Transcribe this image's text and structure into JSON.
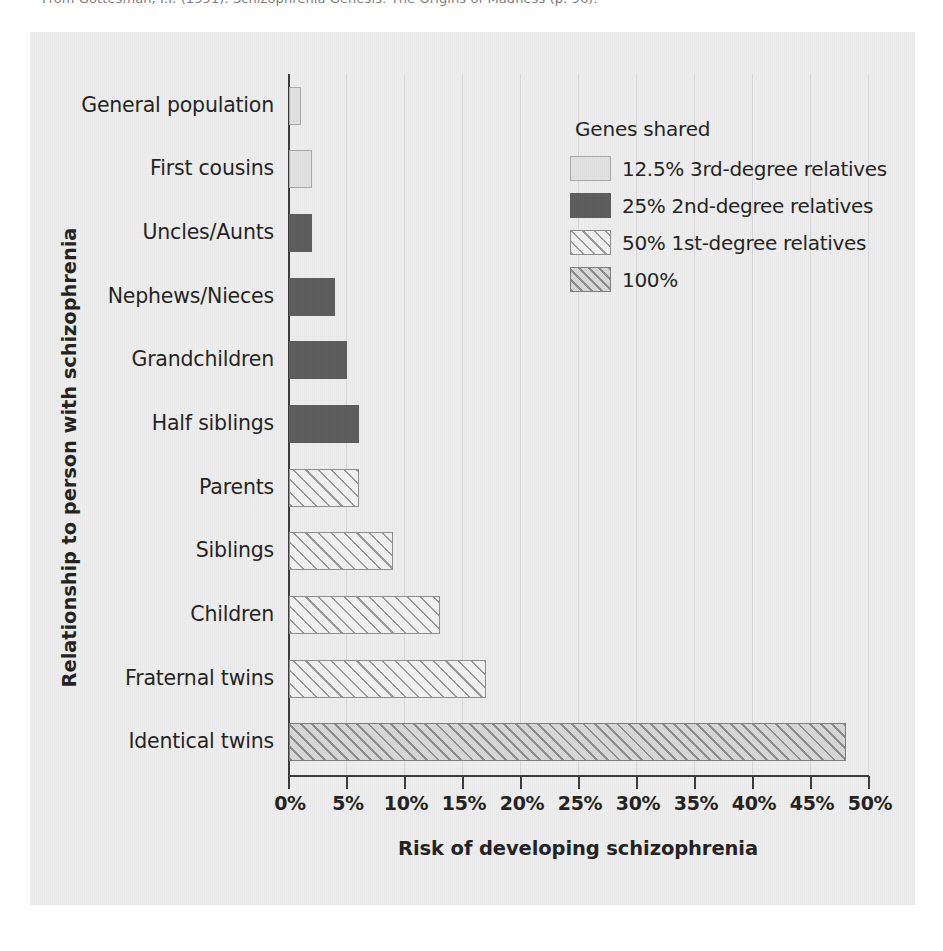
{
  "source_caption": "From Gottesman, I.I. (1991). Schizophrenia Genesis: The Origins of Madness (p. 96).",
  "figure": {
    "background_color": "#eeeeee",
    "axis_color": "#3b3b3b",
    "text_color": "#231f20"
  },
  "legend": {
    "title": "Genes shared",
    "items": [
      {
        "key": "s125",
        "label": "12.5% 3rd-degree relatives",
        "color": "#e2e2e2",
        "pattern": "solid-light"
      },
      {
        "key": "s25",
        "label": "25% 2nd-degree relatives",
        "color": "#5c5c5c",
        "pattern": "solid-dark"
      },
      {
        "key": "s50",
        "label": "50% 1st-degree relatives",
        "color": "#f2f2f2",
        "pattern": "hatch-light"
      },
      {
        "key": "s100",
        "label": "100%",
        "color": "#d8d8d8",
        "pattern": "hatch-gray"
      }
    ]
  },
  "chart_data": {
    "type": "bar",
    "orientation": "horizontal",
    "title": "",
    "xlabel": "Risk of developing schizophrenia",
    "ylabel": "Relationship to person with schizophrenia",
    "xlim": [
      0,
      50
    ],
    "xtick_labels": [
      "0%",
      "5%",
      "10%",
      "15%",
      "20%",
      "25%",
      "30%",
      "35%",
      "40%",
      "45%",
      "50%"
    ],
    "xtick_values": [
      0,
      5,
      10,
      15,
      20,
      25,
      30,
      35,
      40,
      45,
      50
    ],
    "grid": true,
    "legend_position": "upper-right-inside",
    "unit": "%",
    "categories": [
      "General population",
      "First cousins",
      "Uncles/Aunts",
      "Nephews/Nieces",
      "Grandchildren",
      "Half siblings",
      "Parents",
      "Siblings",
      "Children",
      "Fraternal twins",
      "Identical twins"
    ],
    "values": [
      1,
      2,
      2,
      4,
      5,
      6,
      6,
      9,
      13,
      17,
      48
    ],
    "group_keys": [
      "s125",
      "s125",
      "s25",
      "s25",
      "s25",
      "s25",
      "s50",
      "s50",
      "s50",
      "s50",
      "s100"
    ]
  }
}
